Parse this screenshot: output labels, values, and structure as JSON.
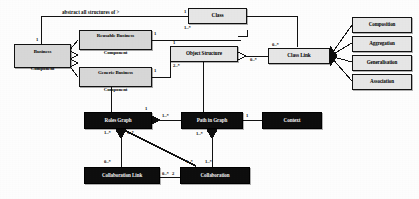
{
  "diagram": {
    "type": "uml-class-diagram",
    "title": "",
    "canvas": {
      "width": 419,
      "height": 199,
      "background": "#fdfdfd"
    },
    "colors": {
      "grey_box_fill": "#d7d7d7",
      "light_box_fill": "#e6e6e6",
      "dark_box_fill": "#0d0d0d",
      "dark_box_text": "#f2f2f2",
      "line": "#111111",
      "text": "#000000"
    }
  },
  "nodes": [
    {
      "id": "business-component",
      "label_line1": "Business",
      "label_line2": "Component",
      "style": "grey"
    },
    {
      "id": "reusable-business-component",
      "label_line1": "Reusable Business",
      "label_line2": "Component",
      "style": "grey"
    },
    {
      "id": "generic-business-component",
      "label_line1": "Generic Business",
      "label_line2": "Component",
      "style": "grey"
    },
    {
      "id": "class",
      "label_line1": "Class",
      "label_line2": "",
      "style": "light"
    },
    {
      "id": "object-structure",
      "label_line1": "Object Structure",
      "label_line2": "",
      "style": "light"
    },
    {
      "id": "class-link",
      "label_line1": "Class Link",
      "label_line2": "",
      "style": "light"
    },
    {
      "id": "composition",
      "label_line1": "Composition",
      "label_line2": "",
      "style": "light"
    },
    {
      "id": "aggregation",
      "label_line1": "Aggregation",
      "label_line2": "",
      "style": "light"
    },
    {
      "id": "generalisation",
      "label_line1": "Generalisation",
      "label_line2": "",
      "style": "light"
    },
    {
      "id": "association",
      "label_line1": "Association",
      "label_line2": "",
      "style": "light"
    },
    {
      "id": "roles-graph",
      "label_line1": "Roles Graph",
      "label_line2": "",
      "style": "dark"
    },
    {
      "id": "path-in-graph",
      "label_line1": "Path in Graph",
      "label_line2": "",
      "style": "dark"
    },
    {
      "id": "context",
      "label_line1": "Context",
      "label_line2": "",
      "style": "dark"
    },
    {
      "id": "collaboration-link",
      "label_line1": "Collaboration Link",
      "label_line2": "",
      "style": "dark"
    },
    {
      "id": "collaboration",
      "label_line1": "Collaboration",
      "label_line2": "",
      "style": "dark"
    }
  ],
  "edge_labels": [
    {
      "id": "abstract-all-structures",
      "text": "abstract all structures of >"
    }
  ],
  "multiplicities": [
    {
      "id": "m-class-top-left",
      "text": "1"
    },
    {
      "id": "m-class-bottom-left",
      "text": "1..*"
    },
    {
      "id": "m-reusable-right",
      "text": "1"
    },
    {
      "id": "m-objstruct-top",
      "text": "1"
    },
    {
      "id": "m-objstruct-bottom",
      "text": "2..*"
    },
    {
      "id": "m-generic-right",
      "text": "1"
    },
    {
      "id": "m-classlink-top",
      "text": "0..*"
    },
    {
      "id": "m-classlink-left",
      "text": "0..*"
    },
    {
      "id": "m-business-top",
      "text": "1"
    },
    {
      "id": "m-rolesgraph-right",
      "text": "1"
    },
    {
      "id": "m-pathgraph-left",
      "text": "1..*"
    },
    {
      "id": "m-pathgraph-right",
      "text": "1"
    },
    {
      "id": "m-rolesgraph-bl",
      "text": "1..*"
    },
    {
      "id": "m-rolesgraph-br",
      "text": "1..*"
    },
    {
      "id": "m-collablink-top",
      "text": "0..*"
    },
    {
      "id": "m-collablink-right",
      "text": "0..*"
    },
    {
      "id": "m-collab-left",
      "text": "2"
    },
    {
      "id": "m-collab-topleft",
      "text": "1..*"
    },
    {
      "id": "m-collab-topright",
      "text": "1..*"
    },
    {
      "id": "m-pathgraph-bottom",
      "text": "1..*"
    }
  ]
}
